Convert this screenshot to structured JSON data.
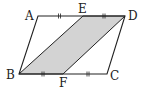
{
  "diagram": {
    "type": "geometry",
    "colors": {
      "stroke": "#222222",
      "fill": "#d3d3d3",
      "background": "#ffffff"
    },
    "points": {
      "A": {
        "label": "A",
        "x": 38,
        "y": 16
      },
      "E": {
        "label": "E",
        "x": 83,
        "y": 16
      },
      "D": {
        "label": "D",
        "x": 125,
        "y": 16
      },
      "B": {
        "label": "B",
        "x": 19,
        "y": 74
      },
      "F": {
        "label": "F",
        "x": 63,
        "y": 74
      },
      "C": {
        "label": "C",
        "x": 107,
        "y": 74
      }
    },
    "outer_shape": "ABCD",
    "shaded_shape": "EBFD",
    "equal_segments": [
      [
        "AE",
        "ED"
      ],
      [
        "BF",
        "FC"
      ]
    ]
  }
}
